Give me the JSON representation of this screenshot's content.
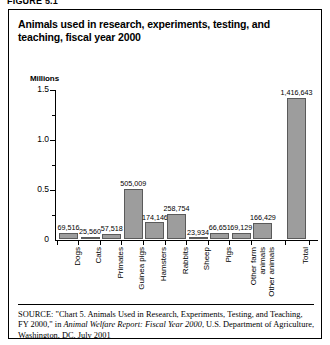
{
  "figure": {
    "caption": "FIGURE 5.1",
    "title": "Animals used in research, experiments, testing, and teaching, fiscal year 2000"
  },
  "source": {
    "kicker": "SOURCE:",
    "part1": " \"Chart 5. Animals Used in Research, Experiments, Testing, and Teaching, FY 2000,\" in ",
    "italic": "Animal Welfare Report: Fiscal Year 2000",
    "part2": ", U.S. Department of Agriculture, Washington, DC, July 2001"
  },
  "chart_data": {
    "type": "bar",
    "title": "Animals used in research, experiments, testing, and teaching, fiscal year 2000",
    "xlabel": "",
    "ylabel": "Millions",
    "ylim": [
      0,
      1.5
    ],
    "yticks": [
      "0",
      "0.5",
      "1.0",
      "1.5"
    ],
    "ytick_values": [
      0,
      0.5,
      1.0,
      1.5
    ],
    "minor_ticks": [
      0.25,
      0.75,
      1.25
    ],
    "grid": false,
    "legend": false,
    "unit": "Millions",
    "categories": [
      "Dogs",
      "Cats",
      "Primates",
      "Guinea pigs",
      "Hamsters",
      "Rabbits",
      "Sheep",
      "Pigs",
      "Other farm animals",
      "Other animals",
      "Total"
    ],
    "values": [
      69516,
      25560,
      57518,
      505009,
      174146,
      258754,
      23934,
      66651,
      69129,
      166429,
      1416643
    ],
    "value_labels": [
      "69,516",
      "25,560",
      "57,518",
      "505,009",
      "174,146",
      "258,754",
      "23,934",
      "66,651",
      "69,129",
      "166,429",
      "1,416,643"
    ],
    "bar_color": "#9d9d9d",
    "bar_border_color": "#5a5a5a"
  }
}
